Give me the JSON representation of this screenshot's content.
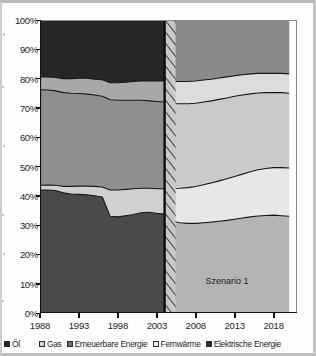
{
  "chart_data": {
    "type": "area",
    "stacked": true,
    "normalized_percent": true,
    "title": "",
    "subtitle": "",
    "xlabel": "",
    "ylabel": "",
    "xlim": [
      1988,
      2021
    ],
    "ylim": [
      0,
      100
    ],
    "grid": false,
    "legend_position": "bottom",
    "x_tick_labels": [
      "1988",
      "1993",
      "1998",
      "2003",
      "2008",
      "2013",
      "2018"
    ],
    "x_tick_values": [
      1988,
      1993,
      1998,
      2003,
      2008,
      2013,
      2018
    ],
    "y_tick_labels": [
      "0%",
      "10%",
      "20%",
      "30%",
      "40%",
      "50%",
      "60%",
      "70%",
      "80%",
      "90%",
      "100%"
    ],
    "y_tick_values": [
      0,
      10,
      20,
      30,
      40,
      50,
      60,
      70,
      80,
      90,
      100
    ],
    "annotations": [
      {
        "text": "Szenario 1",
        "x": 2012,
        "y": 11
      }
    ],
    "divider": {
      "x": 2004,
      "label": "Szenario 1",
      "style": "hatched-band"
    },
    "x": [
      1988,
      1989,
      1990,
      1991,
      1992,
      1993,
      1994,
      1995,
      1996,
      1997,
      1998,
      1999,
      2000,
      2001,
      2002,
      2003,
      2004,
      2005,
      2006,
      2007,
      2008,
      2009,
      2010,
      2011,
      2012,
      2013,
      2014,
      2015,
      2016,
      2017,
      2018,
      2019,
      2020
    ],
    "series": [
      {
        "name": "Elektrische Energie",
        "color": "#4a4a4a",
        "values": [
          42.0,
          42.0,
          41.8,
          41.0,
          40.6,
          40.5,
          40.3,
          40.0,
          39.6,
          33.0,
          32.8,
          33.2,
          33.6,
          34.2,
          34.4,
          34.0,
          33.8,
          31.3,
          30.8,
          30.6,
          30.6,
          30.8,
          31.0,
          31.3,
          31.6,
          32.0,
          32.4,
          32.8,
          33.1,
          33.3,
          33.4,
          33.2,
          33.0
        ]
      },
      {
        "name": "Fernwärme",
        "color": "#d0d0d0",
        "values": [
          1.6,
          1.7,
          1.8,
          2.2,
          2.6,
          2.8,
          3.0,
          3.2,
          3.4,
          9.0,
          9.2,
          9.0,
          8.8,
          8.4,
          8.2,
          8.4,
          8.6,
          11.2,
          11.8,
          12.2,
          12.6,
          13.0,
          13.4,
          13.8,
          14.2,
          14.6,
          15.0,
          15.4,
          15.8,
          16.0,
          16.2,
          16.4,
          16.5
        ]
      },
      {
        "name": "Erneuerbare Energie",
        "color": "#8f8f8f",
        "values": [
          32.6,
          32.4,
          32.2,
          32.0,
          31.8,
          31.6,
          31.4,
          31.2,
          31.0,
          30.8,
          30.6,
          30.4,
          30.2,
          30.0,
          29.8,
          29.8,
          29.6,
          29.0,
          28.8,
          28.6,
          28.4,
          28.2,
          28.0,
          27.8,
          27.6,
          27.4,
          27.0,
          26.6,
          26.2,
          25.9,
          25.6,
          25.6,
          25.5
        ]
      },
      {
        "name": "Gas",
        "color": "#a8a8a8",
        "values": [
          4.4,
          4.5,
          4.6,
          4.8,
          5.0,
          5.2,
          5.4,
          5.4,
          5.6,
          5.8,
          6.0,
          6.2,
          6.4,
          6.6,
          6.8,
          7.0,
          7.2,
          7.5,
          7.6,
          7.6,
          7.6,
          7.5,
          7.4,
          7.3,
          7.2,
          7.0,
          6.9,
          6.8,
          6.7,
          6.6,
          6.6,
          6.6,
          6.6
        ]
      },
      {
        "name": "Öl",
        "color": "#262626",
        "values": [
          19.4,
          19.4,
          19.6,
          20.0,
          20.0,
          19.9,
          19.9,
          20.2,
          20.4,
          21.4,
          21.4,
          21.2,
          21.0,
          20.8,
          20.8,
          20.8,
          20.8,
          21.0,
          21.0,
          21.0,
          20.8,
          20.5,
          20.2,
          19.8,
          19.4,
          19.0,
          18.7,
          18.4,
          18.2,
          18.2,
          18.2,
          18.2,
          18.4
        ]
      }
    ],
    "scenario_palette": {
      "Elektrische Energie": "#b4b4b4",
      "Fernwärme": "#e7e7e7",
      "Erneuerbare Energie": "#cacaca",
      "Gas": "#dcdcdc",
      "Öl": "#8a8a8a"
    }
  },
  "legend": {
    "items": [
      {
        "label": "Öl",
        "color": "#262626"
      },
      {
        "label": "Gas",
        "color": "#d8d8d8"
      },
      {
        "label": "Erneuerbare Energie",
        "color": "#6e6e6e"
      },
      {
        "label": "Fernwärme",
        "color": "#f0f0f0"
      },
      {
        "label": "Elektrische Energie",
        "color": "#2e2e2e"
      }
    ]
  },
  "scenario": {
    "label": "Szenario 1"
  }
}
